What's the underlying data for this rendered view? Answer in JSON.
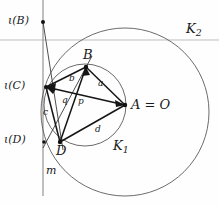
{
  "figure": {
    "kind": "geometry-diagram",
    "width": 219,
    "height": 205,
    "background": "#fefefe",
    "stroke_dark": "#1a1a1a",
    "stroke_circle": "#4a4a4a",
    "stroke_axis": "#b9b9b9"
  },
  "labels": {
    "iota_B": "ι(B)",
    "iota_C": "ι(C)",
    "iota_D": "ι(D)",
    "point_B": "B",
    "point_D": "D",
    "point_A": "A = O",
    "circle_K1": "K",
    "circle_K1_sub": "1",
    "circle_K2": "K",
    "circle_K2_sub": "2",
    "line_m": "m",
    "seg_a": "a",
    "seg_b": "b",
    "seg_c": "c",
    "seg_d": "d",
    "seg_p": "p",
    "seg_q": "q"
  },
  "geometry": {
    "vertical_line_m": {
      "x": 43,
      "y1": 0,
      "y2": 196
    },
    "horizontal_axis": {
      "y": 40,
      "x1": 0,
      "x2": 219
    },
    "circle_K1": {
      "cx": 85,
      "cy": 105,
      "r": 41
    },
    "circle_K2": {
      "cx": 125,
      "cy": 112,
      "r": 84
    },
    "points": {
      "iota_B": {
        "x": 43,
        "y": 22
      },
      "iota_C": {
        "x": 46,
        "y": 87
      },
      "iota_D": {
        "x": 44,
        "y": 142
      },
      "B": {
        "x": 86,
        "y": 67
      },
      "D": {
        "x": 60,
        "y": 142
      },
      "A": {
        "x": 125,
        "y": 105
      }
    },
    "segments": [
      {
        "name": "iotaB-D",
        "from": [
          43,
          22
        ],
        "to": [
          62,
          147
        ]
      },
      {
        "name": "iotaD-B",
        "from": [
          44,
          147
        ],
        "to": [
          90,
          60
        ]
      },
      {
        "name": "B-A",
        "from": [
          86,
          67
        ],
        "to": [
          125,
          105
        ]
      },
      {
        "name": "B-iotaC",
        "from": [
          86,
          67
        ],
        "to": [
          46,
          87
        ]
      },
      {
        "name": "B-D",
        "from": [
          86,
          67
        ],
        "to": [
          60,
          142
        ]
      },
      {
        "name": "iotaC-A",
        "from": [
          46,
          87
        ],
        "to": [
          125,
          105
        ]
      },
      {
        "name": "iotaC-D",
        "from": [
          46,
          87
        ],
        "to": [
          60,
          142
        ]
      },
      {
        "name": "D-A",
        "from": [
          60,
          142
        ],
        "to": [
          125,
          105
        ]
      }
    ]
  },
  "label_positions": {
    "iota_B": {
      "x": 8,
      "y": 15
    },
    "iota_C": {
      "x": 4,
      "y": 80
    },
    "iota_D": {
      "x": 4,
      "y": 134
    },
    "point_B": {
      "x": 83,
      "y": 49
    },
    "point_D": {
      "x": 56,
      "y": 145
    },
    "point_A": {
      "x": 131,
      "y": 97
    },
    "circle_K1": {
      "x": 113,
      "y": 145
    },
    "circle_K2": {
      "x": 186,
      "y": 28
    },
    "line_m": {
      "x": 46,
      "y": 167
    },
    "seg_a": {
      "x": 98,
      "y": 83
    },
    "seg_b": {
      "x": 69,
      "y": 79
    },
    "seg_c": {
      "x": 44,
      "y": 112
    },
    "seg_d": {
      "x": 95,
      "y": 128
    },
    "seg_p": {
      "x": 78,
      "y": 101
    },
    "seg_q": {
      "x": 63,
      "y": 100
    }
  }
}
